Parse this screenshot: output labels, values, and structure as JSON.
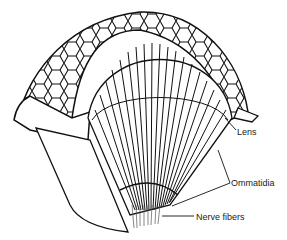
{
  "diagram": {
    "labels": {
      "lens": "Lens",
      "ommatidia": "Ommatidia",
      "nerve_fibers": "Nerve fibers"
    },
    "colors": {
      "line": "#111111",
      "background": "#ffffff",
      "text": "#222222"
    }
  }
}
